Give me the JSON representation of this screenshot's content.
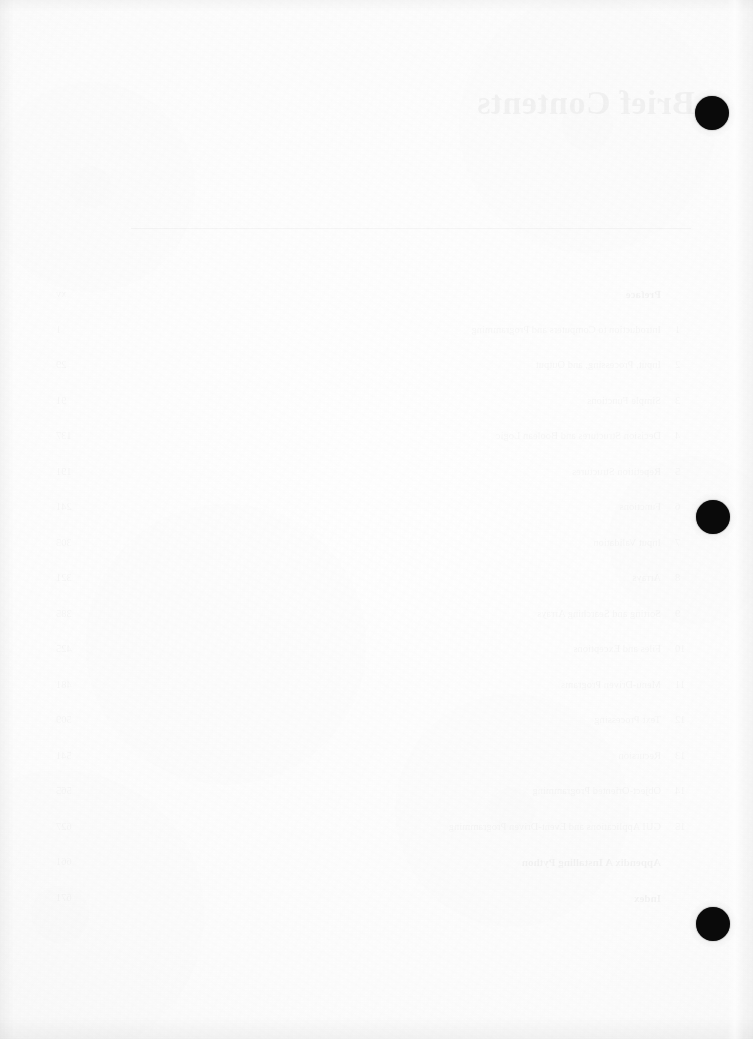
{
  "page": {
    "kind": "scanned-book-page",
    "side": "verso-blank",
    "width": 753,
    "height": 1039,
    "paper_color": "#fdfdfd",
    "ink_color": "#0a0a0a",
    "bleed_ink_color": "rgba(0,0,0,0.035)"
  },
  "bleedthrough": {
    "note": "Mirrored show-through from the reverse (recto) page; text reads backwards.",
    "title": "Brief Contents",
    "rule": true,
    "rows": [
      {
        "num": "",
        "label": "Preface",
        "page": "xv"
      },
      {
        "num": "1",
        "label": "Introduction to Computers and Programming",
        "page": "1"
      },
      {
        "num": "2",
        "label": "Input, Processing, and Output",
        "page": "29"
      },
      {
        "num": "3",
        "label": "Simple Functions",
        "page": "91"
      },
      {
        "num": "4",
        "label": "Decision Structures and Boolean Logic",
        "page": "137"
      },
      {
        "num": "5",
        "label": "Repetition Structures",
        "page": "191"
      },
      {
        "num": "6",
        "label": "Functions",
        "page": "241"
      },
      {
        "num": "7",
        "label": "Input Validation",
        "page": "305"
      },
      {
        "num": "8",
        "label": "Arrays",
        "page": "321"
      },
      {
        "num": "9",
        "label": "Sorting and Searching Arrays",
        "page": "385"
      },
      {
        "num": "10",
        "label": "Files and Exceptions",
        "page": "425"
      },
      {
        "num": "11",
        "label": "Menu-Driven Programs",
        "page": "481"
      },
      {
        "num": "12",
        "label": "Text Processing",
        "page": "509"
      },
      {
        "num": "13",
        "label": "Recursion",
        "page": "541"
      },
      {
        "num": "14",
        "label": "Object-Oriented Programming",
        "page": "565"
      },
      {
        "num": "15",
        "label": "GUI Applications and Event-Driven Programming",
        "page": "627"
      },
      {
        "num": "",
        "label": "Appendix A   Installing Python",
        "page": "661"
      },
      {
        "num": "",
        "label": "Index",
        "page": "671"
      }
    ]
  },
  "punch_dots": [
    {
      "label": "top-punch-dot",
      "cx": 712,
      "cy": 113,
      "r": 17
    },
    {
      "label": "middle-punch-dot",
      "cx": 713,
      "cy": 517,
      "r": 17
    },
    {
      "label": "bottom-punch-dot",
      "cx": 713,
      "cy": 924,
      "r": 17
    }
  ]
}
